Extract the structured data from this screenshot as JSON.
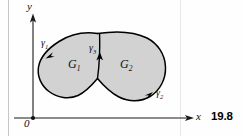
{
  "figure": {
    "number": "19.8",
    "caption_number_label": "19.8"
  },
  "axes": {
    "x_label": "x",
    "y_label": "y",
    "origin_label": "0"
  },
  "regions": [
    {
      "name": "G",
      "subscript": "1",
      "label": "G₁"
    },
    {
      "name": "G",
      "subscript": "2",
      "label": "G₂"
    }
  ],
  "curves": [
    {
      "name": "γ",
      "subscript": "1",
      "label": "γ₁",
      "direction": "down-left"
    },
    {
      "name": "γ",
      "subscript": "2",
      "label": "γ₂",
      "direction": "right"
    },
    {
      "name": "γ",
      "subscript": "3",
      "label": "γ₃",
      "direction": "up"
    }
  ],
  "colors": {
    "region_fill": "#d2d2d2",
    "outline": "#000000",
    "axis": "#1a1a1a",
    "background": "#fefefe",
    "margin_rule": "#bdbdbd"
  },
  "labels": {
    "gamma1": {
      "base": "γ",
      "sub": "1"
    },
    "gamma2": {
      "base": "γ",
      "sub": "2"
    },
    "gamma3": {
      "base": "γ",
      "sub": "3"
    },
    "G1": {
      "base": "G",
      "sub": "1"
    },
    "G2": {
      "base": "G",
      "sub": "2"
    }
  }
}
